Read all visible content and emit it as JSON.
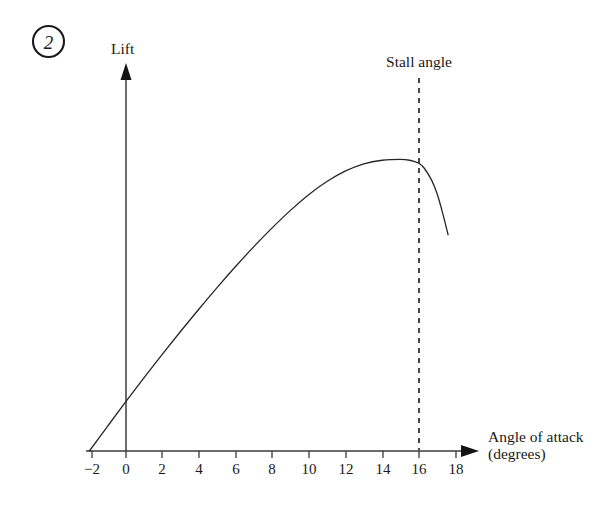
{
  "figure": {
    "marker_label": "2",
    "marker_shape": "circled-number"
  },
  "chart_data": {
    "type": "line",
    "title": "",
    "subtitle": "",
    "xlabel": "Angle of attack",
    "xlabel_line2": "(degrees)",
    "ylabel": "Lift",
    "xlim": [
      -2,
      18
    ],
    "ylim": [
      0,
      1.08
    ],
    "grid": false,
    "legend": null,
    "x_ticks": [
      -2,
      0,
      2,
      4,
      6,
      8,
      10,
      12,
      14,
      16,
      18
    ],
    "x_tick_labels": [
      "−2",
      "0",
      "2",
      "4",
      "6",
      "8",
      "10",
      "12",
      "14",
      "16",
      "18"
    ],
    "y_ticks": [],
    "y_tick_labels": [],
    "axis_arrows": [
      "x-right",
      "y-up"
    ],
    "annotations": [
      {
        "text": "Stall angle",
        "x": 16,
        "style": "dashed-vertical-line",
        "line_top_y": 1.06,
        "line_bottom_y": 0
      }
    ],
    "series": [
      {
        "name": "Lift curve",
        "color": "#262626",
        "line_width": 1.3,
        "x": [
          -2,
          -1,
          0,
          1,
          2,
          3,
          4,
          5,
          6,
          7,
          8,
          9,
          10,
          11,
          12,
          13,
          14,
          15,
          15.5,
          16,
          16.3,
          16.7,
          17,
          17.3,
          17.6
        ],
        "y": [
          0.0,
          0.084,
          0.167,
          0.248,
          0.327,
          0.404,
          0.479,
          0.552,
          0.622,
          0.689,
          0.752,
          0.811,
          0.864,
          0.908,
          0.943,
          0.967,
          0.979,
          0.982,
          0.979,
          0.969,
          0.952,
          0.912,
          0.866,
          0.802,
          0.728
        ]
      }
    ]
  }
}
